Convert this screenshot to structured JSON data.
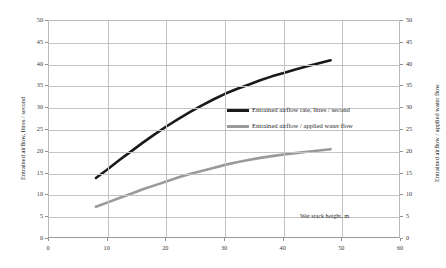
{
  "chart_data": {
    "type": "line",
    "title": "",
    "xlabel": "Wet stack height, m",
    "ylabel": "Entrained airflow, litres / second",
    "y2label": "Entrained airflow / applied water flow",
    "xlim": [
      0,
      60
    ],
    "ylim": [
      0,
      50
    ],
    "y2lim": [
      0,
      50
    ],
    "xticks": [
      0,
      10,
      20,
      30,
      40,
      50,
      60
    ],
    "yticks": [
      0,
      5,
      10,
      15,
      20,
      25,
      30,
      35,
      40,
      45,
      50
    ],
    "y2ticks": [
      0,
      5,
      10,
      15,
      20,
      25,
      30,
      35,
      40,
      45,
      50
    ],
    "grid": true,
    "legend_position": "center-right",
    "series": [
      {
        "name": "Entrained airflow rate, litres / second",
        "color": "#1a1a1a",
        "axis": "left",
        "x": [
          8,
          10,
          12,
          14,
          16,
          18,
          20,
          22,
          24,
          26,
          28,
          30,
          32,
          34,
          36,
          38,
          40,
          42,
          44,
          46,
          48
        ],
        "values": [
          14.0,
          16.0,
          18.1,
          20.1,
          22.1,
          24.0,
          25.8,
          27.5,
          29.1,
          30.6,
          32.0,
          33.3,
          34.4,
          35.4,
          36.4,
          37.3,
          38.1,
          38.9,
          39.6,
          40.3,
          41.0
        ]
      },
      {
        "name": "Entrained airflow / applied water flow",
        "color": "#9a9a9a",
        "axis": "right",
        "x": [
          8,
          10,
          12,
          14,
          16,
          18,
          20,
          22,
          24,
          26,
          28,
          30,
          32,
          34,
          36,
          38,
          40,
          42,
          44,
          46,
          48
        ],
        "values": [
          7.4,
          8.4,
          9.4,
          10.4,
          11.4,
          12.3,
          13.2,
          14.1,
          14.9,
          15.6,
          16.3,
          17.0,
          17.6,
          18.1,
          18.6,
          19.0,
          19.4,
          19.7,
          20.0,
          20.3,
          20.6
        ]
      }
    ]
  },
  "axes": {
    "left": {
      "title": "Entrained airflow, litres / second",
      "tick_labels": [
        "50",
        "45",
        "40",
        "35",
        "30",
        "25",
        "20",
        "15",
        "10",
        "5",
        "0"
      ]
    },
    "right": {
      "title": "Entrained airflow / applied water flow",
      "tick_labels": [
        "50",
        "45",
        "40",
        "35",
        "30",
        "25",
        "20",
        "15",
        "10",
        "5",
        "0"
      ]
    },
    "bottom": {
      "title": "Wet stack height, m",
      "tick_labels": [
        "0",
        "10",
        "20",
        "30",
        "40",
        "50",
        "60"
      ]
    }
  },
  "legend": {
    "items": [
      {
        "label": "Entrained airflow rate, litres / second",
        "color": "#1a1a1a"
      },
      {
        "label": "Entrained airflow / applied water flow",
        "color": "#9a9a9a"
      }
    ]
  },
  "colors": {
    "series_primary": "#1a1a1a",
    "series_secondary": "#9a9a9a",
    "grid": "#c3c3c3",
    "axis": "#9a9a9a",
    "background": "#ffffff"
  }
}
